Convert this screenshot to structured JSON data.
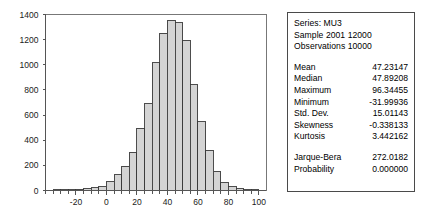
{
  "chart_data": {
    "type": "bar",
    "title": "",
    "xlabel": "",
    "ylabel": "",
    "xlim": [
      -40,
      105
    ],
    "ylim": [
      0,
      1400
    ],
    "grid": false,
    "legend_position": "none",
    "bin_width": 5,
    "x_ticks": [
      -20,
      0,
      20,
      40,
      60,
      80,
      100
    ],
    "x_tick_labels": [
      "-20",
      "0",
      "20",
      "40",
      "60",
      "80",
      "100"
    ],
    "x_minor_ticks": [
      -40,
      -35,
      -30,
      -25,
      -20,
      -15,
      -10,
      -5,
      0,
      5,
      10,
      15,
      20,
      25,
      30,
      35,
      40,
      45,
      50,
      55,
      60,
      65,
      70,
      75,
      80,
      85,
      90,
      95,
      100
    ],
    "y_ticks": [
      0,
      200,
      400,
      600,
      800,
      1000,
      1200,
      1400
    ],
    "y_tick_labels": [
      "0",
      "200",
      "400",
      "600",
      "800",
      "1000",
      "1200",
      "1400"
    ],
    "bins": [
      {
        "x0": -35,
        "x1": -30,
        "count": 2
      },
      {
        "x0": -30,
        "x1": -25,
        "count": 3
      },
      {
        "x0": -25,
        "x1": -20,
        "count": 5
      },
      {
        "x0": -20,
        "x1": -15,
        "count": 8
      },
      {
        "x0": -15,
        "x1": -10,
        "count": 14
      },
      {
        "x0": -10,
        "x1": -5,
        "count": 22
      },
      {
        "x0": -5,
        "x1": 0,
        "count": 28
      },
      {
        "x0": 0,
        "x1": 5,
        "count": 68
      },
      {
        "x0": 5,
        "x1": 10,
        "count": 124
      },
      {
        "x0": 10,
        "x1": 15,
        "count": 193
      },
      {
        "x0": 15,
        "x1": 20,
        "count": 306
      },
      {
        "x0": 20,
        "x1": 25,
        "count": 495
      },
      {
        "x0": 25,
        "x1": 30,
        "count": 689
      },
      {
        "x0": 30,
        "x1": 35,
        "count": 1015
      },
      {
        "x0": 35,
        "x1": 40,
        "count": 1250
      },
      {
        "x0": 40,
        "x1": 45,
        "count": 1355
      },
      {
        "x0": 45,
        "x1": 50,
        "count": 1333
      },
      {
        "x0": 50,
        "x1": 55,
        "count": 1195
      },
      {
        "x0": 55,
        "x1": 60,
        "count": 841
      },
      {
        "x0": 60,
        "x1": 65,
        "count": 548
      },
      {
        "x0": 65,
        "x1": 70,
        "count": 320
      },
      {
        "x0": 70,
        "x1": 75,
        "count": 152
      },
      {
        "x0": 75,
        "x1": 80,
        "count": 62
      },
      {
        "x0": 80,
        "x1": 85,
        "count": 28
      },
      {
        "x0": 85,
        "x1": 90,
        "count": 12
      },
      {
        "x0": 90,
        "x1": 95,
        "count": 5
      },
      {
        "x0": 95,
        "x1": 100,
        "count": 2
      }
    ]
  },
  "stats_panel": {
    "header": {
      "series": "Series: MU3",
      "sample": "Sample 2001 12000",
      "observations": "Observations 10000"
    },
    "moments": [
      {
        "label": "Mean",
        "value": "47.23147"
      },
      {
        "label": "Median",
        "value": "47.89208"
      },
      {
        "label": "Maximum",
        "value": "96.34455"
      },
      {
        "label": "Minimum",
        "value": "-31.99936"
      },
      {
        "label": "Std. Dev.",
        "value": "15.01143"
      },
      {
        "label": "Skewness",
        "value": "-0.338133"
      },
      {
        "label": "Kurtosis",
        "value": "3.442162"
      }
    ],
    "tests": [
      {
        "label": "Jarque-Bera",
        "value": "272.0182"
      },
      {
        "label": "Probability",
        "value": "0.000000"
      }
    ]
  },
  "colors": {
    "bar_fill": "#d4d4d4",
    "bar_stroke": "#3a3a3a",
    "axis": "#555555",
    "panel_border": "#4a4a4a",
    "text": "#000000",
    "background": "#ffffff"
  }
}
